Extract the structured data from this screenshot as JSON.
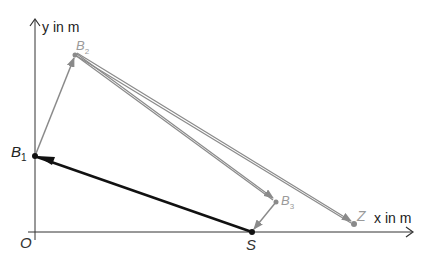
{
  "diagram": {
    "axes": {
      "x_label": "x in m",
      "y_label": "y in m",
      "origin_label": "O"
    },
    "points": {
      "B1": {
        "label": "B",
        "sub": "1",
        "x": 35,
        "y": 156
      },
      "B2": {
        "label": "B",
        "sub": "2",
        "x": 75,
        "y": 55
      },
      "B3": {
        "label": "B",
        "sub": "3",
        "x": 276,
        "y": 202
      },
      "S": {
        "label": "S",
        "x": 252,
        "y": 232
      },
      "Z": {
        "label": "Z",
        "x": 354,
        "y": 224
      }
    },
    "colors": {
      "axis": "#333333",
      "primary_vector": "#111111",
      "secondary_vector": "#8a8a8a",
      "label_gray": "#9a9a9a",
      "label_dark": "#222222"
    }
  }
}
